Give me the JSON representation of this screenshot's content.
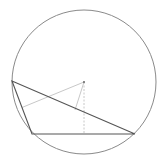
{
  "diagram": {
    "type": "geometry",
    "circle": {
      "cx": 84,
      "cy": 82,
      "r": 72,
      "stroke": "#8a8a8a"
    },
    "center": {
      "x": 84,
      "y": 82,
      "color": "#666666"
    },
    "points": {
      "A": {
        "x": 12,
        "y": 81
      },
      "B": {
        "x": 32,
        "y": 134
      },
      "C": {
        "x": 135,
        "y": 134
      }
    },
    "triangle_stroke": "#555555",
    "aux_stroke": "#c8c8c8",
    "perpendiculars": [
      {
        "to_side": "AB",
        "foot": {
          "x": 22,
          "y": 107.5
        }
      },
      {
        "to_side": "AC",
        "foot": {
          "x": 75,
          "y": 110
        }
      },
      {
        "to_side": "BC",
        "foot": {
          "x": 84,
          "y": 134
        },
        "dashed": true
      }
    ]
  }
}
